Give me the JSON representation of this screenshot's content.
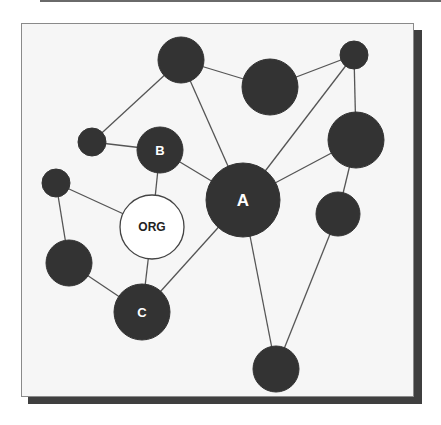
{
  "diagram": {
    "type": "network",
    "colors": {
      "node_dark": "#333333",
      "node_light": "#ffffff",
      "edge": "#555555",
      "background": "#f6f6f6",
      "shadow": "#3f3f3f"
    },
    "nodes": [
      {
        "id": "n1",
        "label": "",
        "x": 181,
        "y": 60,
        "r": 23,
        "fill": "dark"
      },
      {
        "id": "n2",
        "label": "",
        "x": 270,
        "y": 87,
        "r": 28,
        "fill": "dark"
      },
      {
        "id": "n3",
        "label": "",
        "x": 354,
        "y": 55,
        "r": 14,
        "fill": "dark"
      },
      {
        "id": "n4",
        "label": "",
        "x": 92,
        "y": 142,
        "r": 14,
        "fill": "dark"
      },
      {
        "id": "B",
        "label": "B",
        "x": 160,
        "y": 150,
        "r": 23,
        "fill": "dark"
      },
      {
        "id": "n5",
        "label": "",
        "x": 56,
        "y": 183,
        "r": 14,
        "fill": "dark"
      },
      {
        "id": "A",
        "label": "A",
        "x": 243,
        "y": 200,
        "r": 37,
        "fill": "dark"
      },
      {
        "id": "n6",
        "label": "",
        "x": 356,
        "y": 140,
        "r": 28,
        "fill": "dark"
      },
      {
        "id": "n7",
        "label": "",
        "x": 338,
        "y": 214,
        "r": 22,
        "fill": "dark"
      },
      {
        "id": "ORG",
        "label": "ORG",
        "x": 152,
        "y": 227,
        "r": 32,
        "fill": "light"
      },
      {
        "id": "n8",
        "label": "",
        "x": 69,
        "y": 263,
        "r": 23,
        "fill": "dark"
      },
      {
        "id": "C",
        "label": "C",
        "x": 142,
        "y": 312,
        "r": 28,
        "fill": "dark"
      },
      {
        "id": "n9",
        "label": "",
        "x": 276,
        "y": 369,
        "r": 23,
        "fill": "dark"
      }
    ],
    "edges": [
      [
        "n1",
        "n2"
      ],
      [
        "n1",
        "n4"
      ],
      [
        "n1",
        "A"
      ],
      [
        "n2",
        "n3"
      ],
      [
        "n3",
        "A"
      ],
      [
        "n3",
        "n6"
      ],
      [
        "n4",
        "B"
      ],
      [
        "B",
        "A"
      ],
      [
        "B",
        "ORG"
      ],
      [
        "n5",
        "ORG"
      ],
      [
        "n5",
        "n8"
      ],
      [
        "A",
        "n6"
      ],
      [
        "A",
        "C"
      ],
      [
        "A",
        "n9"
      ],
      [
        "n6",
        "n7"
      ],
      [
        "n7",
        "n9"
      ],
      [
        "ORG",
        "C"
      ],
      [
        "n8",
        "C"
      ]
    ]
  }
}
